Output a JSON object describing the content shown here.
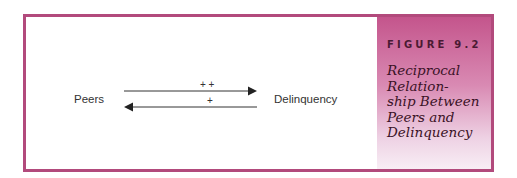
{
  "figure": {
    "label": "FIGURE 9.2",
    "title_lines": [
      "Reciprocal",
      "Relation-",
      "ship Between",
      "Peers and",
      "Delinquency"
    ]
  },
  "diagram": {
    "nodes": {
      "left": "Peers",
      "right": "Delinquency"
    },
    "edges": [
      {
        "from": "Peers",
        "to": "Delinquency",
        "sign": "+ +"
      },
      {
        "from": "Delinquency",
        "to": "Peers",
        "sign": "+"
      }
    ]
  },
  "colors": {
    "border": "#b24a7c",
    "panel_top": "#c4558c",
    "panel_bottom": "#f8eef5",
    "text": "#333333"
  }
}
